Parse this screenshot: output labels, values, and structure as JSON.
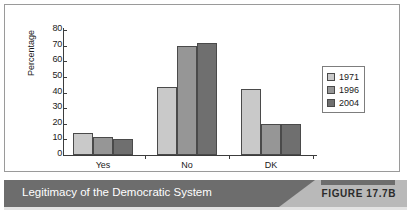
{
  "figure": {
    "caption": "Legitimacy of the Democratic System",
    "badge": "FIGURE 17.7B"
  },
  "colors": {
    "series_1971": "#c9c9c9",
    "series_1996": "#969696",
    "series_2004": "#6f6f6f",
    "caption_bar": "#6d6d6d",
    "caption_wedge": "#b9b9b9",
    "axis": "#3c3c3c"
  },
  "chart_data": {
    "type": "bar",
    "title": "",
    "xlabel": "",
    "ylabel": "Percentage",
    "categories": [
      "Yes",
      "No",
      "DK"
    ],
    "series": [
      {
        "name": "1971",
        "values": [
          14,
          43.5,
          42.5
        ]
      },
      {
        "name": "1996",
        "values": [
          11.5,
          69.5,
          20
        ]
      },
      {
        "name": "2004",
        "values": [
          10,
          71.5,
          20
        ]
      }
    ],
    "ylim": [
      0,
      80
    ],
    "yticks": [
      0,
      10,
      20,
      30,
      40,
      50,
      60,
      70,
      80
    ],
    "ytick_labels": [
      "0",
      "10",
      "20",
      "30",
      "40",
      "50",
      "60",
      "70",
      "80"
    ],
    "grid": false,
    "legend": {
      "position": "right",
      "entries": [
        "1971",
        "1996",
        "2004"
      ]
    }
  }
}
